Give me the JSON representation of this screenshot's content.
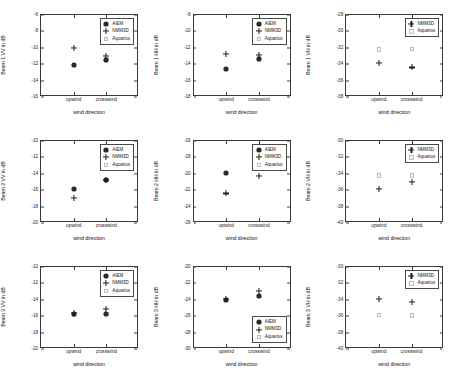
{
  "figure": {
    "layout": {
      "rows": 3,
      "cols": 3
    },
    "xlabel": "wind direction",
    "categories": [
      "upwind",
      "crosswind"
    ],
    "series_names": {
      "aiem": "AIEM",
      "nmm3d": "NMM3D",
      "aquarius": "Aquarius"
    }
  },
  "chart_data": [
    {
      "type": "scatter",
      "title": "",
      "ylabel": "Beam 1 VV in dB",
      "xlabel": "wind direction",
      "categories": [
        "upwind",
        "crosswind"
      ],
      "ylim": [
        -16,
        -6
      ],
      "yticks": [
        -6,
        -8,
        -10,
        -12,
        -14,
        -16
      ],
      "grid": false,
      "legend": "top-right",
      "series": [
        {
          "name": "AIEM",
          "marker": "filled-circle",
          "values": [
            -12.1,
            -11.5
          ]
        },
        {
          "name": "NMM3D",
          "marker": "plus",
          "values": [
            -10.0,
            -11.0
          ]
        },
        {
          "name": "Aquarius",
          "marker": "open-square",
          "values": [
            -12.1,
            -11.4
          ]
        }
      ]
    },
    {
      "type": "scatter",
      "title": "",
      "ylabel": "Beam 1 HH in dB",
      "xlabel": "wind direction",
      "categories": [
        "upwind",
        "crosswind"
      ],
      "ylim": [
        -18,
        -8
      ],
      "yticks": [
        -8,
        -10,
        -12,
        -14,
        -16,
        -18
      ],
      "grid": false,
      "legend": "top-right",
      "series": [
        {
          "name": "AIEM",
          "marker": "filled-circle",
          "values": [
            -14.6,
            -13.4
          ]
        },
        {
          "name": "NMM3D",
          "marker": "plus",
          "values": [
            -12.7,
            -12.9
          ]
        },
        {
          "name": "Aquarius",
          "marker": "open-square",
          "values": [
            -14.6,
            -13.3
          ]
        }
      ]
    },
    {
      "type": "scatter",
      "title": "",
      "ylabel": "Beam 1 VH in dB",
      "xlabel": "wind direction",
      "categories": [
        "upwind",
        "crosswind"
      ],
      "ylim": [
        -38,
        -28
      ],
      "yticks": [
        -28,
        -30,
        -32,
        -34,
        -36,
        -38
      ],
      "grid": false,
      "legend": "top-right",
      "series": [
        {
          "name": "NMM3D",
          "marker": "plus",
          "values": [
            -33.9,
            -34.4
          ]
        },
        {
          "name": "Aquarius",
          "marker": "open-square",
          "values": [
            -32.2,
            -32.1
          ]
        }
      ]
    },
    {
      "type": "scatter",
      "title": "",
      "ylabel": "Beam 2 VV in dB",
      "xlabel": "wind direction",
      "categories": [
        "upwind",
        "crosswind"
      ],
      "ylim": [
        -20,
        -10
      ],
      "yticks": [
        -10,
        -12,
        -14,
        -16,
        -18,
        -20
      ],
      "grid": false,
      "legend": "top-right",
      "series": [
        {
          "name": "AIEM",
          "marker": "filled-circle",
          "values": [
            -15.8,
            -14.7
          ]
        },
        {
          "name": "NMM3D",
          "marker": "plus",
          "values": [
            -17.0,
            -14.8
          ]
        },
        {
          "name": "Aquarius",
          "marker": "open-square",
          "values": [
            -15.8,
            -14.7
          ]
        }
      ]
    },
    {
      "type": "scatter",
      "title": "",
      "ylabel": "Beam 2 HH in dB",
      "xlabel": "wind direction",
      "categories": [
        "upwind",
        "crosswind"
      ],
      "ylim": [
        -26,
        -16
      ],
      "yticks": [
        -16,
        -18,
        -20,
        -22,
        -24,
        -26
      ],
      "grid": false,
      "legend": "top-right",
      "series": [
        {
          "name": "AIEM",
          "marker": "filled-circle",
          "values": [
            -19.9,
            -19.0
          ]
        },
        {
          "name": "NMM3D",
          "marker": "plus",
          "values": [
            -22.4,
            -20.3
          ]
        },
        {
          "name": "Aquarius",
          "marker": "open-square",
          "values": [
            -19.9,
            -19.0
          ]
        }
      ]
    },
    {
      "type": "scatter",
      "title": "",
      "ylabel": "Beam 2 VH in dB",
      "xlabel": "wind direction",
      "categories": [
        "upwind",
        "crosswind"
      ],
      "ylim": [
        -40,
        -30
      ],
      "yticks": [
        -30,
        -32,
        -34,
        -36,
        -38,
        -40
      ],
      "grid": false,
      "legend": "top-right",
      "series": [
        {
          "name": "NMM3D",
          "marker": "plus",
          "values": [
            -35.8,
            -35.0
          ]
        },
        {
          "name": "Aquarius",
          "marker": "open-square",
          "values": [
            -34.2,
            -34.2
          ]
        }
      ]
    },
    {
      "type": "scatter",
      "title": "",
      "ylabel": "Beam 3 VV in dB",
      "xlabel": "wind direction",
      "categories": [
        "upwind",
        "crosswind"
      ],
      "ylim": [
        -20,
        -10
      ],
      "yticks": [
        -10,
        -12,
        -14,
        -16,
        -18,
        -20
      ],
      "grid": false,
      "legend": "top-right",
      "series": [
        {
          "name": "AIEM",
          "marker": "filled-circle",
          "values": [
            -15.7,
            -15.7
          ]
        },
        {
          "name": "NMM3D",
          "marker": "plus",
          "values": [
            -15.6,
            -15.1
          ]
        },
        {
          "name": "Aquarius",
          "marker": "open-square",
          "values": [
            -15.8,
            -15.7
          ]
        }
      ]
    },
    {
      "type": "scatter",
      "title": "",
      "ylabel": "Beam 3 HH in dB",
      "xlabel": "wind direction",
      "categories": [
        "upwind",
        "crosswind"
      ],
      "ylim": [
        -30,
        -20
      ],
      "yticks": [
        -20,
        -22,
        -24,
        -26,
        -28,
        -30
      ],
      "grid": false,
      "legend": "bottom-right",
      "series": [
        {
          "name": "AIEM",
          "marker": "filled-circle",
          "values": [
            -24.0,
            -23.5
          ]
        },
        {
          "name": "NMM3D",
          "marker": "plus",
          "values": [
            -23.9,
            -22.9
          ]
        },
        {
          "name": "Aquarius",
          "marker": "open-square",
          "values": [
            -24.0,
            -23.5
          ]
        }
      ]
    },
    {
      "type": "scatter",
      "title": "",
      "ylabel": "Beam 3 VH in dB",
      "xlabel": "wind direction",
      "categories": [
        "upwind",
        "crosswind"
      ],
      "ylim": [
        -40,
        -30
      ],
      "yticks": [
        -30,
        -32,
        -34,
        -36,
        -38,
        -40
      ],
      "grid": false,
      "legend": "top-right",
      "series": [
        {
          "name": "NMM3D",
          "marker": "plus",
          "values": [
            -33.9,
            -34.3
          ]
        },
        {
          "name": "Aquarius",
          "marker": "open-square",
          "values": [
            -35.8,
            -35.9
          ]
        }
      ]
    }
  ]
}
